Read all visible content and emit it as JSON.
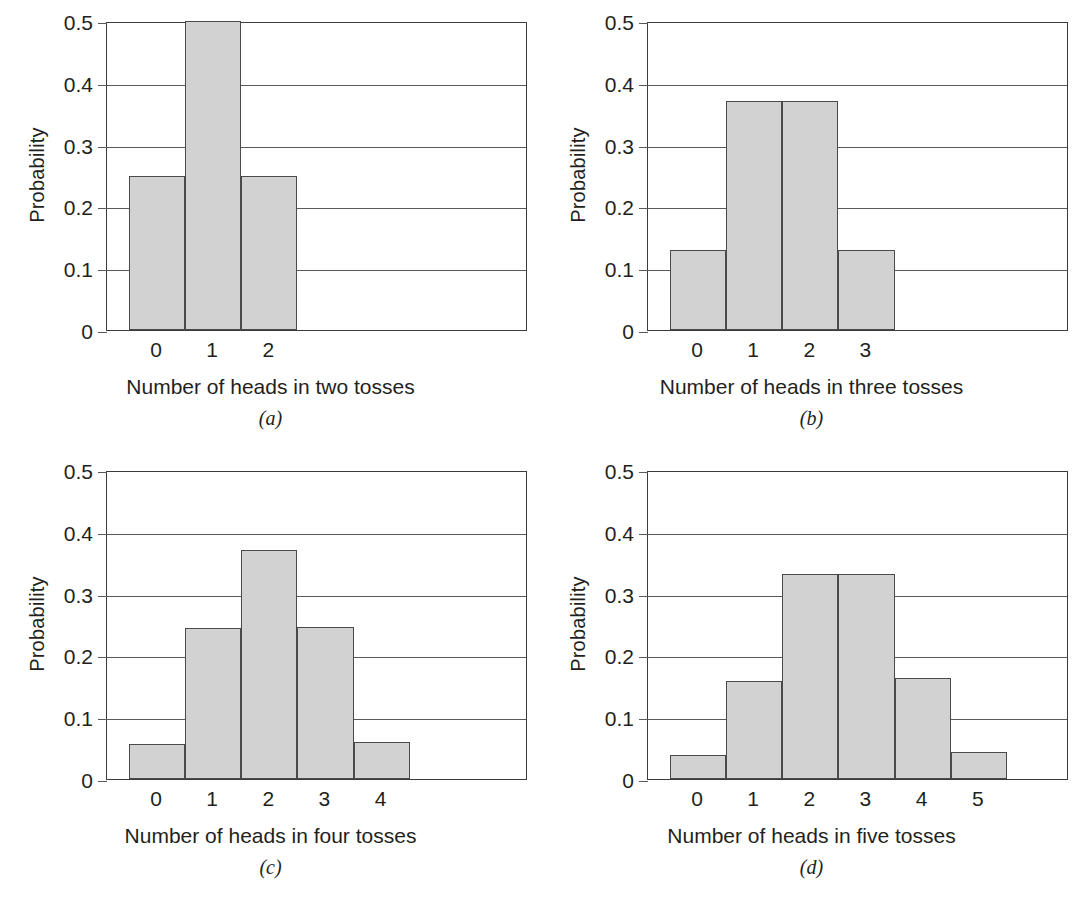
{
  "figure": {
    "ylabel": "Probability",
    "y_ticks": [
      "0.5",
      "0.4",
      "0.3",
      "0.2",
      "0.1",
      "0"
    ],
    "bar_fill_color": "#d2d2d2",
    "bar_edge_color": "#4a4a4a",
    "axis_color": "#3b3b3b",
    "background_color": "#ffffff"
  },
  "chart_data": [
    {
      "type": "bar",
      "panel": "a",
      "caption": "(a)",
      "title": "",
      "xlabel": "Number of heads in two tosses",
      "ylabel": "Probability",
      "categories": [
        "0",
        "1",
        "2"
      ],
      "values": [
        0.25,
        0.5,
        0.25
      ],
      "ylim": [
        0,
        0.5
      ],
      "yticks": [
        0,
        0.1,
        0.2,
        0.3,
        0.4,
        0.5
      ],
      "grid": true,
      "slots": 7.5,
      "legend": "none"
    },
    {
      "type": "bar",
      "panel": "b",
      "caption": "(b)",
      "title": "",
      "xlabel": "Number of heads in three tosses",
      "ylabel": "Probability",
      "categories": [
        "0",
        "1",
        "2",
        "3"
      ],
      "values": [
        0.13,
        0.37,
        0.37,
        0.13
      ],
      "ylim": [
        0,
        0.5
      ],
      "yticks": [
        0,
        0.1,
        0.2,
        0.3,
        0.4,
        0.5
      ],
      "grid": true,
      "slots": 7.5,
      "legend": "none"
    },
    {
      "type": "bar",
      "panel": "c",
      "caption": "(c)",
      "title": "",
      "xlabel": "Number of heads in four tosses",
      "ylabel": "Probability",
      "categories": [
        "0",
        "1",
        "2",
        "3",
        "4"
      ],
      "values": [
        0.057,
        0.244,
        0.371,
        0.246,
        0.06
      ],
      "ylim": [
        0,
        0.5
      ],
      "yticks": [
        0,
        0.1,
        0.2,
        0.3,
        0.4,
        0.5
      ],
      "grid": true,
      "slots": 7.5,
      "legend": "none"
    },
    {
      "type": "bar",
      "panel": "d",
      "caption": "(d)",
      "title": "",
      "xlabel": "Number of heads in five tosses",
      "ylabel": "Probability",
      "categories": [
        "0",
        "1",
        "2",
        "3",
        "4",
        "5"
      ],
      "values": [
        0.039,
        0.159,
        0.331,
        0.331,
        0.163,
        0.044
      ],
      "ylim": [
        0,
        0.5
      ],
      "yticks": [
        0,
        0.1,
        0.2,
        0.3,
        0.4,
        0.5
      ],
      "grid": true,
      "slots": 7.5,
      "legend": "none"
    }
  ]
}
